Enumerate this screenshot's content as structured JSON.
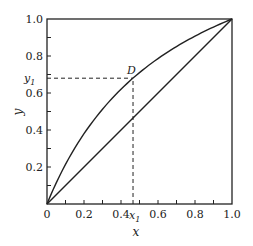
{
  "chart_data": {
    "type": "line",
    "title": "",
    "xlabel": "x",
    "ylabel": "y",
    "xlim": [
      0,
      1.0
    ],
    "ylim": [
      0,
      1.0
    ],
    "grid": false,
    "legend": null,
    "x_ticks": [
      {
        "value": 0,
        "label": "0"
      },
      {
        "value": 0.2,
        "label": "0.2"
      },
      {
        "value": 0.4,
        "label": "0.4"
      },
      {
        "value": 0.6,
        "label": "0.6"
      },
      {
        "value": 0.8,
        "label": "0.8"
      },
      {
        "value": 1.0,
        "label": "1.0"
      }
    ],
    "y_ticks": [
      {
        "value": 0.2,
        "label": "0.2"
      },
      {
        "value": 0.4,
        "label": "0.4"
      },
      {
        "value": 0.6,
        "label": "0.6"
      },
      {
        "value": 0.8,
        "label": "0.8"
      },
      {
        "value": 1.0,
        "label": "1.0"
      }
    ],
    "minor_tick_step": 0.1,
    "series": [
      {
        "name": "equilibrium curve",
        "style": "solid",
        "relative_volatility": 2.45,
        "x": [
          0,
          0.1,
          0.2,
          0.3,
          0.4,
          0.465,
          0.5,
          0.6,
          0.7,
          0.8,
          0.9,
          1.0
        ],
        "y": [
          0,
          0.21,
          0.38,
          0.51,
          0.62,
          0.68,
          0.71,
          0.79,
          0.85,
          0.91,
          0.96,
          1.0
        ]
      },
      {
        "name": "diagonal y=x",
        "style": "solid",
        "x": [
          0,
          1.0
        ],
        "y": [
          0,
          1.0
        ]
      }
    ],
    "annotations": [
      {
        "type": "point",
        "label": "D",
        "x": 0.465,
        "y": 0.68
      },
      {
        "type": "dashed-hline",
        "y": 0.68,
        "x_from": 0,
        "x_to": 0.465,
        "tick_label": "y₁"
      },
      {
        "type": "dashed-vline",
        "x": 0.465,
        "y_from": 0,
        "y_to": 0.68,
        "tick_label": "x₁"
      }
    ]
  },
  "labels": {
    "xlabel": "x",
    "ylabel": "y",
    "point_D": "D",
    "x1_main": "x",
    "x1_sub": "1",
    "y1_main": "y",
    "y1_sub": "1"
  },
  "colors": {
    "line": "#222222",
    "axes": "#222222",
    "background": "#ffffff"
  }
}
